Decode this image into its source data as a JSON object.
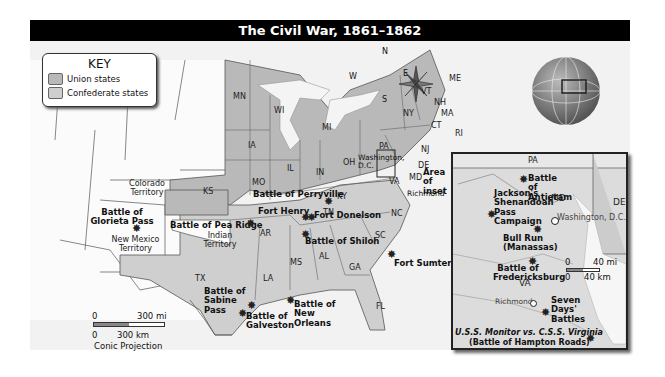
{
  "title": "The Civil War, 1861–1862",
  "key": {
    "heading": "KEY",
    "items": [
      {
        "label": "Union states",
        "color": "#b9b9b9"
      },
      {
        "label": "Confederate states",
        "color": "#cfcfcf"
      }
    ]
  },
  "compass": {
    "n": "N",
    "s": "S",
    "e": "E",
    "w": "W"
  },
  "states": {
    "MN": "MN",
    "WI": "WI",
    "MI": "MI",
    "IA": "IA",
    "IL": "IL",
    "IN": "IN",
    "OH": "OH",
    "MO": "MO",
    "KS": "KS",
    "KY": "KY",
    "PA": "PA",
    "NY": "NY",
    "VT": "VT",
    "NH": "NH",
    "ME": "ME",
    "MA": "MA",
    "CT": "CT",
    "RI": "RI",
    "NJ": "NJ",
    "DE": "DE",
    "MD": "MD",
    "VA": "VA",
    "NC": "NC",
    "SC": "SC",
    "TN": "TN",
    "AR": "AR",
    "MS": "MS",
    "AL": "AL",
    "GA": "GA",
    "LA": "LA",
    "TX": "TX",
    "FL": "FL"
  },
  "territories": {
    "colorado": "Colorado Territory",
    "new_mexico": "New Mexico Territory",
    "indian": "Indian Territory"
  },
  "cities": {
    "washington": "Washington, D.C.",
    "richmond": "Richmond",
    "area_of_inset": "Area of inset"
  },
  "battles": {
    "glorieta": "Battle of Glorieta Pass",
    "pea_ridge": "Battle of Pea Ridge",
    "perryville": "Battle of Perryville",
    "fort_henry": "Fort Henry",
    "fort_donelson": "Fort Donelson",
    "shiloh": "Battle of Shiloh",
    "fort_sumter": "Fort Sumter",
    "sabine_pass": "Battle of Sabine Pass",
    "galveston": "Battle of Galveston",
    "new_orleans": "Battle of New Orleans"
  },
  "scale": {
    "mi_zero": "0",
    "mi": "300 mi",
    "km_zero": "0",
    "km": "300 km",
    "projection": "Conic Projection"
  },
  "inset": {
    "states": {
      "PA": "PA",
      "MD": "MD",
      "DE": "DE",
      "VA": "VA"
    },
    "washington": "Washington, D.C.",
    "richmond": "Richmond",
    "battles": {
      "antietam": "Battle of Antietam",
      "shenandoah": "Jackson's Shenandoah Pass Campaign",
      "bull_run": "Bull Run (Manassas)",
      "fredericksburg": "Battle of Fredericksburg",
      "seven_days": "Seven Days' Battles",
      "hampton_roads_1": "U.S.S. Monitor vs. C.S.S. Virginia",
      "hampton_roads_2": "(Battle of Hampton Roads)"
    },
    "scale": {
      "mi_zero": "0",
      "mi": "40 mi",
      "km_zero": "0",
      "km": "40 km"
    }
  },
  "colors": {
    "union": "#b9b9b9",
    "confederate": "#cfcfcf",
    "water": "#f4f4f4",
    "title_bg": "#000000"
  }
}
